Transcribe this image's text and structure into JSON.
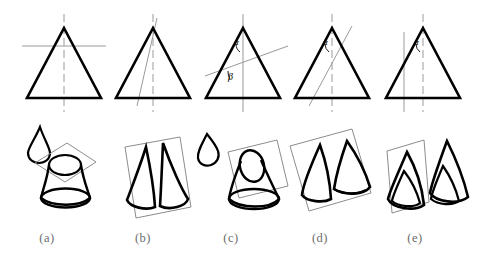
{
  "figure": {
    "stroke_colors": {
      "cone_outline": "#000000",
      "cutting_plane": "#8c8c8c",
      "axis": "#9a9a9a",
      "plane_rectangle": "#7f7f7f",
      "caption_text": "#6d6d6d"
    },
    "panel_count": 5
  },
  "captions": [
    {
      "label": "(a)",
      "x": 47
    },
    {
      "label": "(b)",
      "x": 143
    },
    {
      "label": "(c)",
      "x": 231
    },
    {
      "label": "(d)",
      "x": 320
    },
    {
      "label": "(e)",
      "x": 415
    }
  ],
  "panels": [
    {
      "id": "a",
      "caption": "(a)",
      "section_type": "circle",
      "cut_description": "plane perpendicular to the axis",
      "angle_labels": [],
      "has_axis": true,
      "axis_style": "dashed",
      "solid_description": "cone with horizontal circular cut, small cone cap displaced above"
    },
    {
      "id": "b",
      "caption": "(b)",
      "section_type": "triangle",
      "cut_description": "plane containing the apex and the axis",
      "angle_labels": [],
      "has_axis": true,
      "axis_style": "dashed",
      "solid_description": "cone split by an axial plane into two halves"
    },
    {
      "id": "c",
      "caption": "(c)",
      "section_type": "ellipse",
      "cut_description": "plane oblique to the axis, cutting all generators",
      "angle_labels": [
        "α",
        "β"
      ],
      "has_axis": true,
      "axis_style": "solid",
      "solid_description": "cone with oblique elliptical cut, elliptical cap displaced above"
    },
    {
      "id": "d",
      "caption": "(d)",
      "section_type": "parabola",
      "cut_description": "plane parallel to one generator",
      "angle_labels": [
        "α"
      ],
      "has_axis": true,
      "axis_style": "dashed",
      "solid_description": "cone with parabolic cut, parabolic piece displaced to the right"
    },
    {
      "id": "e",
      "caption": "(e)",
      "section_type": "hyperbola",
      "cut_description": "plane parallel to the axis",
      "angle_labels": [
        "α"
      ],
      "has_axis": true,
      "axis_style": "dashed",
      "solid_description": "cone with hyperbolic cut parallel to the axis, piece displaced to the right"
    }
  ]
}
